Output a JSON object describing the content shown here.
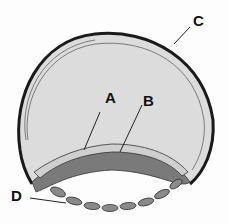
{
  "diagram": {
    "labels": [
      {
        "id": "A",
        "text": "A"
      },
      {
        "id": "B",
        "text": "B"
      },
      {
        "id": "C",
        "text": "C"
      },
      {
        "id": "D",
        "text": "D"
      }
    ],
    "colors": {
      "outline": "#1a1a1a",
      "interior": "#d9d9d9",
      "cells": "#777777",
      "background": "#fdfdfd"
    }
  }
}
